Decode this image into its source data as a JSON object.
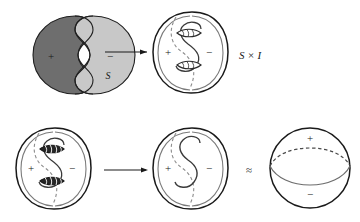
{
  "figure": {
    "background_color": "#ffffff",
    "ink_color": "#1a1a1a",
    "dark_region_color": "#6e6e6e",
    "light_region_color": "#c8c8c8",
    "width": 360,
    "height": 222
  },
  "rows": [
    {
      "row_name": "top-row",
      "panels": [
        {
          "panel_name": "shaded-lobes-panel",
          "kind": "two-shaded-lobes",
          "labels": {
            "plus": "+",
            "minus": "−",
            "surface": "S"
          }
        },
        {
          "panel_name": "sphere-with-bands-panel",
          "kind": "sphere-with-s-curve-and-two-bands",
          "labels": {
            "plus": "+",
            "minus": "−"
          }
        }
      ],
      "arrow": {
        "arrow_name": "top-transform-arrow",
        "direction": "right"
      },
      "annotation": {
        "annotation_name": "product-label",
        "text": "S × I"
      }
    },
    {
      "row_name": "bottom-row",
      "panels": [
        {
          "panel_name": "sphere-with-hatched-bands-panel",
          "kind": "sphere-with-s-curve-and-two-hatched-bands",
          "labels": {
            "plus": "+",
            "minus": "−"
          }
        },
        {
          "panel_name": "sphere-with-plain-curve-panel",
          "kind": "sphere-with-s-curve",
          "labels": {
            "plus": "+",
            "minus": "−"
          }
        },
        {
          "panel_name": "plain-sphere-panel",
          "kind": "sphere-with-equator",
          "labels": {
            "plus": "+",
            "minus": "−"
          }
        }
      ],
      "arrow": {
        "arrow_name": "bottom-transform-arrow",
        "direction": "right"
      },
      "annotation": {
        "annotation_name": "homeomorphic-symbol",
        "text": "≈"
      }
    }
  ]
}
